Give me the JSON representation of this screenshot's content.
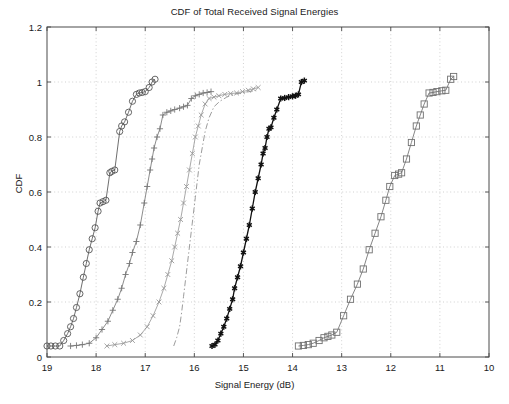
{
  "chart_data": {
    "type": "line",
    "title": "CDF of Total Received Signal Energies",
    "xlabel": "Signal Energy (dB)",
    "ylabel": "CDF",
    "xlim": [
      19,
      10
    ],
    "ylim": [
      0,
      1.2
    ],
    "x_reversed": true,
    "xticks": [
      19,
      18,
      17,
      16,
      15,
      14,
      13,
      12,
      11,
      10
    ],
    "yticks": [
      0,
      0.2,
      0.4,
      0.6,
      0.8,
      1,
      1.2
    ],
    "xtick_labels": [
      "19",
      "18",
      "17",
      "16",
      "15",
      "14",
      "13",
      "12",
      "11",
      "10"
    ],
    "ytick_labels": [
      "0",
      "0.2",
      "0.4",
      "0.6",
      "0.8",
      "1",
      "1.2"
    ],
    "grid": true,
    "grid_style": "dotted",
    "legend": null,
    "legend_position": "none",
    "series": [
      {
        "name": "series-1",
        "marker": "circle",
        "line_style": "solid",
        "color": "#555555",
        "points": [
          [
            19.0,
            0.04
          ],
          [
            18.92,
            0.04
          ],
          [
            18.83,
            0.04
          ],
          [
            18.74,
            0.04
          ],
          [
            18.66,
            0.06
          ],
          [
            18.58,
            0.085
          ],
          [
            18.52,
            0.11
          ],
          [
            18.46,
            0.14
          ],
          [
            18.4,
            0.18
          ],
          [
            18.33,
            0.23
          ],
          [
            18.26,
            0.29
          ],
          [
            18.2,
            0.34
          ],
          [
            18.14,
            0.39
          ],
          [
            18.08,
            0.43
          ],
          [
            18.02,
            0.47
          ],
          [
            17.96,
            0.53
          ],
          [
            17.92,
            0.56
          ],
          [
            17.86,
            0.565
          ],
          [
            17.8,
            0.57
          ],
          [
            17.72,
            0.67
          ],
          [
            17.68,
            0.675
          ],
          [
            17.62,
            0.68
          ],
          [
            17.52,
            0.82
          ],
          [
            17.48,
            0.84
          ],
          [
            17.42,
            0.855
          ],
          [
            17.34,
            0.89
          ],
          [
            17.26,
            0.93
          ],
          [
            17.18,
            0.955
          ],
          [
            17.12,
            0.96
          ],
          [
            17.06,
            0.962
          ],
          [
            17.0,
            0.965
          ],
          [
            16.92,
            0.98
          ],
          [
            16.86,
            1.0
          ],
          [
            16.8,
            1.01
          ]
        ]
      },
      {
        "name": "series-2",
        "marker": "plus",
        "line_style": "solid",
        "color": "#777777",
        "points": [
          [
            18.52,
            0.04
          ],
          [
            18.4,
            0.042
          ],
          [
            18.28,
            0.045
          ],
          [
            18.14,
            0.05
          ],
          [
            18.0,
            0.07
          ],
          [
            17.88,
            0.1
          ],
          [
            17.76,
            0.13
          ],
          [
            17.66,
            0.17
          ],
          [
            17.56,
            0.21
          ],
          [
            17.48,
            0.25
          ],
          [
            17.4,
            0.3
          ],
          [
            17.32,
            0.34
          ],
          [
            17.26,
            0.38
          ],
          [
            17.18,
            0.42
          ],
          [
            17.1,
            0.48
          ],
          [
            17.02,
            0.56
          ],
          [
            16.96,
            0.62
          ],
          [
            16.9,
            0.68
          ],
          [
            16.86,
            0.72
          ],
          [
            16.82,
            0.76
          ],
          [
            16.76,
            0.8
          ],
          [
            16.7,
            0.83
          ],
          [
            16.64,
            0.88
          ],
          [
            16.56,
            0.89
          ],
          [
            16.48,
            0.895
          ],
          [
            16.4,
            0.9
          ],
          [
            16.3,
            0.905
          ],
          [
            16.22,
            0.91
          ],
          [
            16.14,
            0.915
          ],
          [
            16.06,
            0.94
          ],
          [
            15.98,
            0.95
          ],
          [
            15.9,
            0.955
          ],
          [
            15.82,
            0.96
          ],
          [
            15.74,
            0.962
          ],
          [
            15.66,
            0.965
          ]
        ]
      },
      {
        "name": "series-3",
        "marker": "x",
        "line_style": "solid",
        "color": "#999999",
        "points": [
          [
            17.78,
            0.04
          ],
          [
            17.62,
            0.045
          ],
          [
            17.44,
            0.05
          ],
          [
            17.26,
            0.06
          ],
          [
            17.1,
            0.08
          ],
          [
            16.96,
            0.11
          ],
          [
            16.84,
            0.15
          ],
          [
            16.72,
            0.2
          ],
          [
            16.62,
            0.25
          ],
          [
            16.54,
            0.3
          ],
          [
            16.46,
            0.35
          ],
          [
            16.4,
            0.4
          ],
          [
            16.34,
            0.45
          ],
          [
            16.28,
            0.5
          ],
          [
            16.22,
            0.56
          ],
          [
            16.16,
            0.62
          ],
          [
            16.1,
            0.68
          ],
          [
            16.04,
            0.74
          ],
          [
            15.98,
            0.8
          ],
          [
            15.92,
            0.84
          ],
          [
            15.86,
            0.88
          ],
          [
            15.78,
            0.92
          ],
          [
            15.7,
            0.94
          ],
          [
            15.6,
            0.945
          ],
          [
            15.5,
            0.95
          ],
          [
            15.38,
            0.955
          ],
          [
            15.26,
            0.958
          ],
          [
            15.14,
            0.96
          ],
          [
            15.02,
            0.965
          ],
          [
            14.9,
            0.97
          ],
          [
            14.8,
            0.975
          ],
          [
            14.7,
            0.98
          ]
        ]
      },
      {
        "name": "series-4",
        "marker": "none",
        "line_style": "dashdot",
        "color": "#8a8a8a",
        "points": [
          [
            16.42,
            0.04
          ],
          [
            16.36,
            0.07
          ],
          [
            16.3,
            0.11
          ],
          [
            16.26,
            0.16
          ],
          [
            16.22,
            0.22
          ],
          [
            16.18,
            0.28
          ],
          [
            16.14,
            0.34
          ],
          [
            16.1,
            0.4
          ],
          [
            16.06,
            0.46
          ],
          [
            16.02,
            0.52
          ],
          [
            15.98,
            0.58
          ],
          [
            15.94,
            0.64
          ],
          [
            15.9,
            0.7
          ],
          [
            15.84,
            0.76
          ],
          [
            15.78,
            0.82
          ],
          [
            15.7,
            0.87
          ],
          [
            15.6,
            0.91
          ],
          [
            15.48,
            0.93
          ],
          [
            15.34,
            0.945
          ],
          [
            15.2,
            0.955
          ],
          [
            15.04,
            0.96
          ],
          [
            14.88,
            0.965
          ],
          [
            14.74,
            0.97
          ]
        ]
      },
      {
        "name": "series-5",
        "marker": "star",
        "line_style": "solid",
        "color": "#111111",
        "points": [
          [
            15.64,
            0.04
          ],
          [
            15.58,
            0.045
          ],
          [
            15.52,
            0.06
          ],
          [
            15.46,
            0.085
          ],
          [
            15.4,
            0.11
          ],
          [
            15.34,
            0.14
          ],
          [
            15.28,
            0.175
          ],
          [
            15.22,
            0.21
          ],
          [
            15.18,
            0.25
          ],
          [
            15.12,
            0.29
          ],
          [
            15.06,
            0.33
          ],
          [
            15.0,
            0.38
          ],
          [
            14.94,
            0.43
          ],
          [
            14.88,
            0.48
          ],
          [
            14.82,
            0.54
          ],
          [
            14.76,
            0.6
          ],
          [
            14.7,
            0.65
          ],
          [
            14.64,
            0.7
          ],
          [
            14.6,
            0.74
          ],
          [
            14.56,
            0.76
          ],
          [
            14.52,
            0.8
          ],
          [
            14.48,
            0.83
          ],
          [
            14.44,
            0.835
          ],
          [
            14.38,
            0.87
          ],
          [
            14.32,
            0.9
          ],
          [
            14.24,
            0.94
          ],
          [
            14.16,
            0.942
          ],
          [
            14.08,
            0.945
          ],
          [
            14.0,
            0.948
          ],
          [
            13.94,
            0.95
          ],
          [
            13.88,
            0.955
          ],
          [
            13.82,
            1.0
          ],
          [
            13.76,
            1.005
          ]
        ]
      },
      {
        "name": "series-6",
        "marker": "square",
        "line_style": "solid",
        "color": "#707070",
        "points": [
          [
            13.88,
            0.04
          ],
          [
            13.78,
            0.042
          ],
          [
            13.68,
            0.045
          ],
          [
            13.58,
            0.05
          ],
          [
            13.46,
            0.06
          ],
          [
            13.36,
            0.07
          ],
          [
            13.28,
            0.075
          ],
          [
            13.2,
            0.08
          ],
          [
            13.1,
            0.09
          ],
          [
            12.96,
            0.15
          ],
          [
            12.82,
            0.21
          ],
          [
            12.68,
            0.265
          ],
          [
            12.56,
            0.32
          ],
          [
            12.44,
            0.39
          ],
          [
            12.32,
            0.45
          ],
          [
            12.2,
            0.51
          ],
          [
            12.1,
            0.57
          ],
          [
            12.02,
            0.62
          ],
          [
            11.92,
            0.66
          ],
          [
            11.84,
            0.665
          ],
          [
            11.78,
            0.67
          ],
          [
            11.68,
            0.72
          ],
          [
            11.58,
            0.78
          ],
          [
            11.48,
            0.84
          ],
          [
            11.4,
            0.88
          ],
          [
            11.32,
            0.92
          ],
          [
            11.22,
            0.96
          ],
          [
            11.14,
            0.962
          ],
          [
            11.06,
            0.965
          ],
          [
            10.96,
            0.968
          ],
          [
            10.88,
            0.97
          ],
          [
            10.78,
            1.01
          ],
          [
            10.72,
            1.02
          ]
        ]
      }
    ]
  },
  "axes": {
    "title": "CDF of Total Received Signal Energies",
    "xlabel": "Signal Energy (dB)",
    "ylabel": "CDF"
  }
}
